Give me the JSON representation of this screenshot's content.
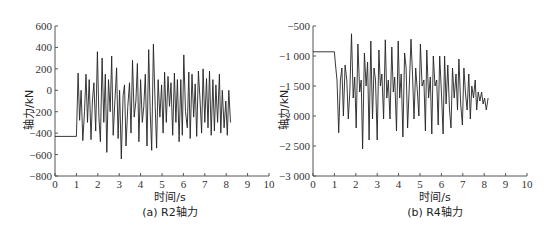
{
  "chart_data": [
    {
      "type": "line",
      "caption": "(a) R2轴力",
      "title": "",
      "xlabel": "时间/s",
      "ylabel": "轴力/kN",
      "xlim": [
        0,
        10
      ],
      "ylim": [
        -800,
        600
      ],
      "xticks": [
        0,
        1,
        2,
        3,
        4,
        5,
        6,
        7,
        8,
        9,
        10
      ],
      "yticks": [
        600,
        400,
        200,
        0,
        -200,
        -400,
        -600,
        -800
      ],
      "grid": false,
      "legend": null,
      "series": [
        {
          "name": "R2轴力",
          "color": "#222222",
          "x": [
            0,
            1.0,
            1.02,
            1.08,
            1.15,
            1.22,
            1.3,
            1.38,
            1.45,
            1.52,
            1.6,
            1.68,
            1.75,
            1.82,
            1.9,
            1.98,
            2.05,
            2.12,
            2.2,
            2.28,
            2.35,
            2.42,
            2.5,
            2.58,
            2.65,
            2.72,
            2.8,
            2.88,
            2.95,
            3.02,
            3.1,
            3.18,
            3.25,
            3.32,
            3.4,
            3.48,
            3.55,
            3.62,
            3.7,
            3.78,
            3.85,
            3.92,
            4.0,
            4.08,
            4.15,
            4.22,
            4.3,
            4.38,
            4.45,
            4.52,
            4.6,
            4.68,
            4.75,
            4.82,
            4.9,
            4.98,
            5.05,
            5.12,
            5.2,
            5.28,
            5.35,
            5.42,
            5.5,
            5.58,
            5.65,
            5.72,
            5.8,
            5.88,
            5.95,
            6.02,
            6.1,
            6.18,
            6.25,
            6.32,
            6.4,
            6.48,
            6.55,
            6.62,
            6.7,
            6.78,
            6.85,
            6.92,
            7.0,
            7.08,
            7.15,
            7.22,
            7.3,
            7.38,
            7.45,
            7.52,
            7.6,
            7.68,
            7.75,
            7.82,
            7.9,
            7.98,
            8.05,
            8.12,
            8.2,
            8.28,
            8.35,
            8.42,
            8.5,
            8.58,
            8.65,
            8.72,
            8.8,
            8.88,
            8.95,
            9.0
          ],
          "y": [
            -430,
            -430,
            -300,
            160,
            -280,
            0,
            -470,
            -200,
            150,
            -300,
            100,
            -460,
            -100,
            70,
            -380,
            360,
            -250,
            -480,
            300,
            -300,
            150,
            -580,
            100,
            -200,
            320,
            -420,
            -100,
            210,
            -450,
            0,
            -640,
            -50,
            50,
            -520,
            -150,
            70,
            -400,
            280,
            -250,
            -100,
            250,
            -480,
            100,
            -300,
            -150,
            150,
            -520,
            380,
            -200,
            -560,
            430,
            -150,
            -540,
            100,
            -250,
            50,
            -400,
            170,
            -300,
            130,
            -150,
            70,
            -420,
            160,
            -300,
            100,
            -480,
            100,
            -420,
            330,
            -200,
            -350,
            170,
            -450,
            150,
            -250,
            60,
            -430,
            180,
            -100,
            -400,
            200,
            -300,
            110,
            -350,
            180,
            -420,
            100,
            -380,
            50,
            -300,
            150,
            -400,
            0,
            -350,
            -100,
            -420,
            0,
            -300
          ]
        }
      ]
    },
    {
      "type": "line",
      "caption": "(b) R4轴力",
      "title": "",
      "xlabel": "时间/s",
      "ylabel": "轴力/kN",
      "xlim": [
        0,
        10
      ],
      "ylim": [
        -3000,
        -500
      ],
      "xticks": [
        0,
        1,
        2,
        3,
        4,
        5,
        6,
        7,
        8,
        9,
        10
      ],
      "yticks": [
        -500,
        -1000,
        -1500,
        -2000,
        -2500,
        -3000
      ],
      "grid": false,
      "legend": null,
      "series": [
        {
          "name": "R4轴力",
          "color": "#222222",
          "x": [
            0,
            1.0,
            1.05,
            1.12,
            1.2,
            1.28,
            1.35,
            1.42,
            1.5,
            1.58,
            1.65,
            1.72,
            1.8,
            1.88,
            1.95,
            2.02,
            2.1,
            2.18,
            2.25,
            2.32,
            2.4,
            2.48,
            2.55,
            2.62,
            2.7,
            2.78,
            2.85,
            2.92,
            3.0,
            3.08,
            3.15,
            3.22,
            3.3,
            3.38,
            3.45,
            3.52,
            3.6,
            3.68,
            3.75,
            3.82,
            3.9,
            3.98,
            4.05,
            4.12,
            4.2,
            4.28,
            4.35,
            4.42,
            4.5,
            4.58,
            4.65,
            4.72,
            4.8,
            4.88,
            4.95,
            5.02,
            5.1,
            5.18,
            5.25,
            5.32,
            5.4,
            5.48,
            5.55,
            5.62,
            5.7,
            5.78,
            5.85,
            5.92,
            6.0,
            6.08,
            6.15,
            6.22,
            6.3,
            6.38,
            6.45,
            6.52,
            6.6,
            6.68,
            6.75,
            6.82,
            6.9,
            6.98,
            7.05,
            7.12,
            7.2,
            7.28,
            7.35,
            7.42,
            7.5,
            7.58,
            7.65,
            7.72,
            7.8,
            7.88,
            7.95,
            8.02,
            8.1,
            8.18,
            8.25,
            8.32,
            8.4,
            8.48,
            8.55,
            8.62,
            8.7,
            8.78,
            8.85,
            8.92,
            9.0
          ],
          "y": [
            -930,
            -930,
            -1150,
            -1400,
            -2280,
            -1400,
            -1200,
            -2000,
            -1150,
            -1400,
            -2050,
            -1600,
            -630,
            -1700,
            -1350,
            -2200,
            -800,
            -1600,
            -1400,
            -2550,
            -950,
            -1500,
            -1100,
            -2400,
            -750,
            -2050,
            -1200,
            -1400,
            -2400,
            -900,
            -1500,
            -1300,
            -2050,
            -730,
            -1700,
            -1400,
            -2050,
            -850,
            -1600,
            -1350,
            -2250,
            -750,
            -1700,
            -1300,
            -2350,
            -950,
            -1200,
            -2200,
            -1500,
            -720,
            -1300,
            -2050,
            -1200,
            -1600,
            -2000,
            -800,
            -1500,
            -1400,
            -2250,
            -900,
            -1700,
            -1350,
            -2300,
            -1000,
            -1500,
            -1400,
            -2150,
            -1000,
            -1600,
            -2300,
            -1000,
            -1800,
            -1150,
            -1900,
            -2200,
            -1200,
            -1700,
            -1300,
            -1900,
            -1050,
            -1800,
            -2150,
            -1200,
            -1600,
            -1900,
            -1300,
            -2050,
            -1500,
            -1700,
            -1400,
            -1900,
            -1600,
            -1750,
            -1600,
            -1800,
            -1700,
            -1900,
            -1700
          ]
        }
      ]
    }
  ],
  "panels": {
    "left": {
      "ylabel": "轴力/kN",
      "xlabel": "时间/s",
      "caption": "(a) R2轴力"
    },
    "right": {
      "ylabel": "轴力/kN",
      "xlabel": "时间/s",
      "caption": "(b) R4轴力"
    }
  }
}
